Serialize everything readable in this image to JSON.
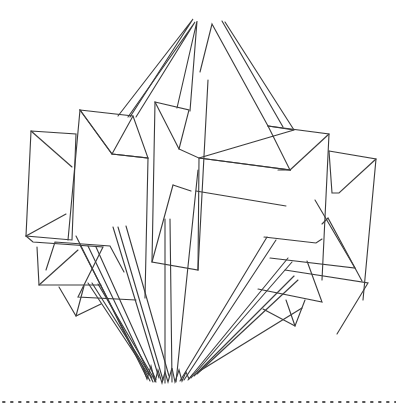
{
  "figure": {
    "stroke_color": "#3a3a3a",
    "background_color": "#ffffff",
    "divider": {
      "style": "dotted",
      "color": "#555555"
    }
  }
}
